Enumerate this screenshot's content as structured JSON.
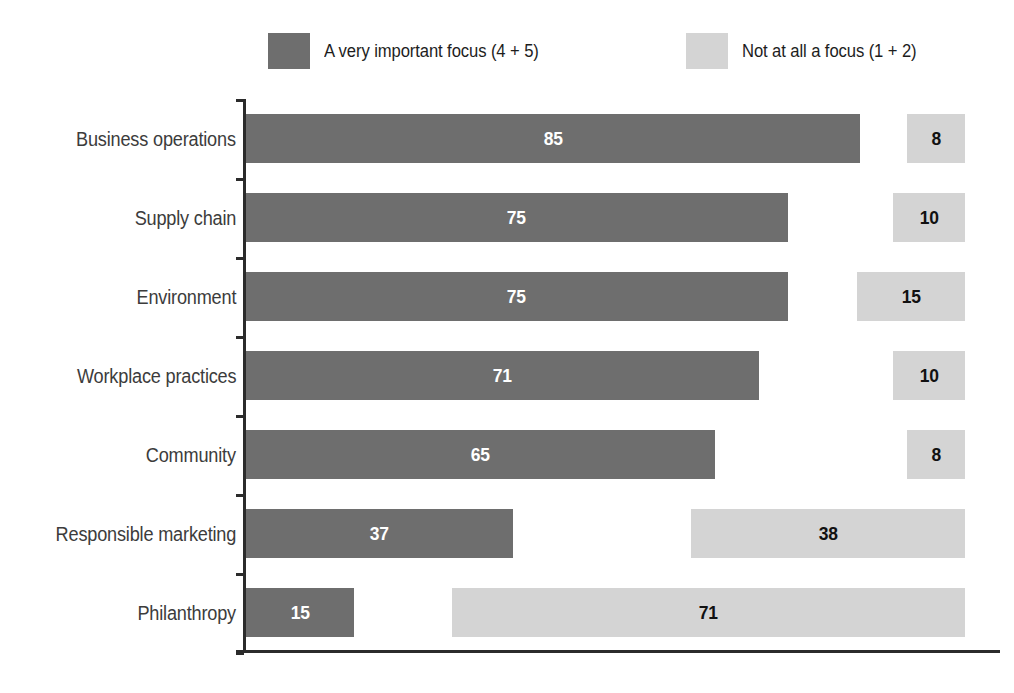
{
  "legend": {
    "entries": [
      {
        "label": "A very important focus (4 + 5)",
        "color": "#6e6e6e",
        "swatch": "dark-swatch"
      },
      {
        "label": "Not at all a focus (1 + 2)",
        "color": "#d4d4d4",
        "swatch": "light-swatch"
      }
    ]
  },
  "chart_data": {
    "type": "bar",
    "title": "",
    "subtitle": "",
    "xlabel": "",
    "ylabel": "",
    "orientation": "horizontal",
    "layout": "paired diverging: dark series grows rightward from axis, light series is right-aligned to plot edge",
    "grid": false,
    "legend_position": "top",
    "xlim": [
      0,
      100
    ],
    "categories": [
      "Business operations",
      "Supply chain",
      "Environment",
      "Workplace practices",
      "Community",
      "Responsible marketing",
      "Philanthropy"
    ],
    "series": [
      {
        "name": "A very important focus (4 + 5)",
        "color": "#6e6e6e",
        "values": [
          85,
          75,
          75,
          71,
          65,
          37,
          15
        ]
      },
      {
        "name": "Not at all a focus (1 + 2)",
        "color": "#d4d4d4",
        "values": [
          8,
          10,
          15,
          10,
          8,
          38,
          71
        ]
      }
    ]
  },
  "axis": {
    "tick_count": 8
  }
}
